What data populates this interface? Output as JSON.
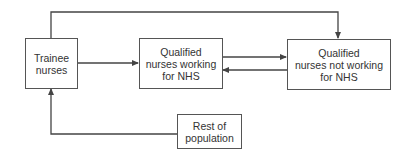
{
  "diagram": {
    "type": "flow",
    "nodes": [
      {
        "id": "trainee",
        "lines": [
          "Trainee",
          "nurses"
        ]
      },
      {
        "id": "qual_nhs",
        "lines": [
          "Qualified",
          "nurses working",
          "for NHS"
        ]
      },
      {
        "id": "qual_not_nhs",
        "lines": [
          "Qualified",
          "nurses not working",
          "for NHS"
        ]
      },
      {
        "id": "rest",
        "lines": [
          "Rest of",
          "population"
        ]
      }
    ],
    "edges": [
      {
        "from": "trainee",
        "to": "qual_nhs"
      },
      {
        "from": "trainee",
        "to": "qual_not_nhs"
      },
      {
        "from": "qual_nhs",
        "to": "qual_not_nhs"
      },
      {
        "from": "qual_not_nhs",
        "to": "qual_nhs"
      },
      {
        "from": "rest",
        "to": "trainee"
      }
    ],
    "colors": {
      "line": "#444444",
      "text": "#333333",
      "background": "#ffffff"
    }
  }
}
